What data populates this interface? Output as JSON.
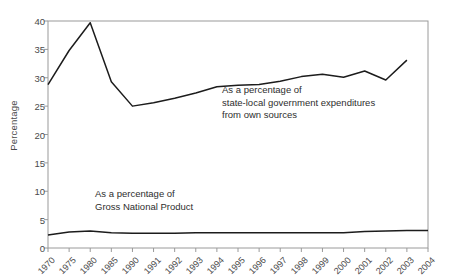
{
  "chart_data": {
    "type": "line",
    "title": "",
    "xlabel": "",
    "ylabel": "Percentage",
    "ylim": [
      0,
      40
    ],
    "ytick_values": [
      0,
      5,
      10,
      15,
      20,
      25,
      30,
      35,
      40
    ],
    "ytick_labels": [
      "0",
      "5",
      "10",
      "15",
      "20",
      "25",
      "30",
      "35",
      "40"
    ],
    "grid": false,
    "legend_position": "inline-annotations",
    "categories": [
      "1970",
      "1975",
      "1980",
      "1985",
      "1990",
      "1991",
      "1992",
      "1993",
      "1994",
      "1995",
      "1996",
      "1997",
      "1998",
      "1999",
      "2000",
      "2001",
      "2002",
      "2003",
      "2004"
    ],
    "series": [
      {
        "name": "As a percentage of state-local government expenditures from own sources",
        "values": [
          28.8,
          34.8,
          39.7,
          29.3,
          25.0,
          25.6,
          26.4,
          27.3,
          28.4,
          28.7,
          28.8,
          29.4,
          30.2,
          30.6,
          30.1,
          31.2,
          29.6,
          33.1,
          null
        ]
      },
      {
        "name": "As a percentage of Gross National Product",
        "values": [
          2.3,
          2.8,
          3.0,
          2.7,
          2.6,
          2.6,
          2.6,
          2.7,
          2.7,
          2.7,
          2.7,
          2.7,
          2.7,
          2.7,
          2.7,
          2.9,
          3.0,
          3.1,
          3.1
        ]
      }
    ],
    "annotations": [
      {
        "id": "upper",
        "text": "As a percentage of\nstate-local government expenditures\nfrom own sources"
      },
      {
        "id": "lower",
        "text": "As a percentage of\nGross National Product"
      }
    ],
    "colors": {
      "line": "#1c1c1c",
      "axis": "#9a9a9a",
      "text": "#3b3b3b",
      "background": "#ffffff"
    }
  }
}
